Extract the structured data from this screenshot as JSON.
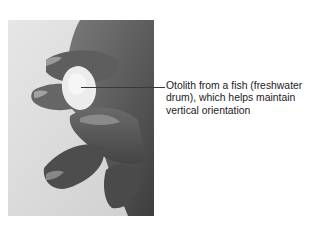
{
  "figure": {
    "top_text_fragment": "",
    "photo": {
      "subject": "hand holding an otolith between fingers",
      "style": "grayscale photograph"
    },
    "callout": {
      "label": "Otolith from a fish (freshwater drum), which helps maintain vertical orientation",
      "lines": [
        "Otolith from a fish (freshwater",
        "drum), which helps maintain",
        "vertical orientation"
      ]
    }
  }
}
